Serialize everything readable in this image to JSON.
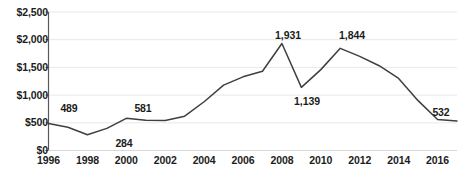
{
  "chart_data": {
    "type": "line",
    "title": "",
    "subtitle": "",
    "xlabel": "",
    "ylabel": "",
    "grid": true,
    "legend": "none",
    "xlim": [
      1996,
      2017
    ],
    "ylim": [
      0,
      2500
    ],
    "y_ticks": [
      0,
      500,
      1000,
      1500,
      2000,
      2500
    ],
    "y_tick_labels": [
      "$0",
      "$500",
      "$1,000",
      "$1,500",
      "$2,000",
      "$2,500"
    ],
    "x_ticks": [
      1996,
      1998,
      2000,
      2002,
      2004,
      2006,
      2008,
      2010,
      2012,
      2014,
      2016
    ],
    "x_tick_labels": [
      "1996",
      "1998",
      "2000",
      "2002",
      "2004",
      "2006",
      "2008",
      "2010",
      "2012",
      "2014",
      "2016"
    ],
    "x": [
      1996,
      1997,
      1998,
      1999,
      2000,
      2001,
      2002,
      2003,
      2004,
      2005,
      2006,
      2007,
      2008,
      2009,
      2010,
      2011,
      2012,
      2013,
      2014,
      2015,
      2016,
      2017
    ],
    "values": [
      489,
      420,
      284,
      400,
      581,
      545,
      540,
      620,
      880,
      1180,
      1330,
      1430,
      1931,
      1139,
      1460,
      1844,
      1700,
      1530,
      1300,
      900,
      560,
      532
    ],
    "series": [
      {
        "name": "value",
        "color": "#3f3f3f",
        "values": [
          489,
          420,
          284,
          400,
          581,
          545,
          540,
          620,
          880,
          1180,
          1330,
          1430,
          1931,
          1139,
          1460,
          1844,
          1700,
          1530,
          1300,
          900,
          560,
          532
        ]
      }
    ],
    "data_labels": [
      {
        "text": "489",
        "x": 1996,
        "y": 489,
        "px": 69,
        "py": 108
      },
      {
        "text": "284",
        "x": 1998,
        "y": 284,
        "px": 124,
        "py": 143
      },
      {
        "text": "581",
        "x": 2000,
        "y": 581,
        "px": 143,
        "py": 108
      },
      {
        "text": "1,931",
        "x": 2008,
        "y": 1931,
        "px": 288,
        "py": 35
      },
      {
        "text": "1,139",
        "x": 2009,
        "y": 1139,
        "px": 307,
        "py": 101
      },
      {
        "text": "1,844",
        "x": 2011,
        "y": 1844,
        "px": 352,
        "py": 35
      },
      {
        "text": "532",
        "x": 2017,
        "y": 532,
        "px": 441,
        "py": 112
      }
    ],
    "colors": {
      "line": "#3f3f3f",
      "axis": "#595959",
      "grid": "#e8e8e8",
      "text": "#1c1c1c",
      "background": "#ffffff"
    }
  }
}
